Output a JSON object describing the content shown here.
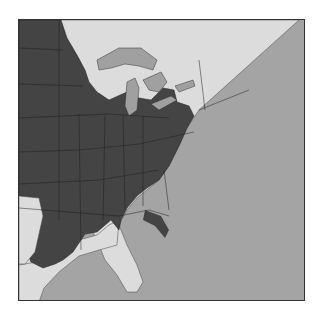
{
  "map": {
    "region": "Eastern United States",
    "legend": [],
    "colors": {
      "ocean": "#a4a4a4",
      "land_unshaded": "#dcdcdc",
      "shaded_range": "#444444",
      "lakes": "#a0a0a0",
      "borders": "#1e1e1e",
      "frame": "#333333"
    },
    "shaded_area_description": "Dark shading covers the central and south-central US east of the Plains through the Ohio Valley and interior Southeast, extending into Pennsylvania and southern New York; coastal plains, Great Lakes fringe, New England and peninsular Florida are light."
  }
}
